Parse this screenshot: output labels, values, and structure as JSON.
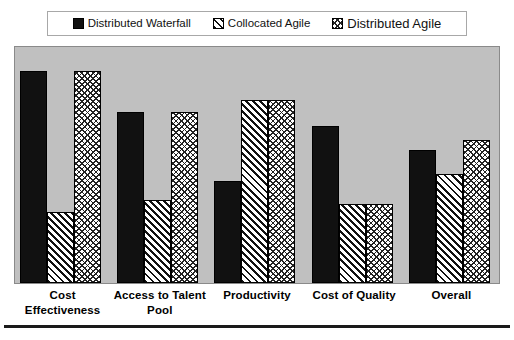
{
  "legend": {
    "items": [
      {
        "label": "Distributed Waterfall",
        "pattern": "dotted-dark",
        "swatch_color": "#111111"
      },
      {
        "label": "Collocated Agile",
        "pattern": "diagonal",
        "swatch_color": "#ffffff"
      },
      {
        "label": "Distributed Agile",
        "pattern": "crosshatch",
        "swatch_color": "#ffffff"
      }
    ]
  },
  "chart_data": {
    "type": "bar",
    "title": "",
    "xlabel": "",
    "ylabel": "",
    "ylim": [
      0,
      100
    ],
    "grid": false,
    "legend_position": "top",
    "categories": [
      "Cost Effectiveness",
      "Access to Talent Pool",
      "Productivity",
      "Cost of Quality",
      "Overall"
    ],
    "category_lines": [
      [
        "Cost",
        "Effectiveness"
      ],
      [
        "Access to Talent",
        "Pool"
      ],
      [
        "Productivity"
      ],
      [
        "Cost of Quality"
      ],
      [
        "Overall"
      ]
    ],
    "series": [
      {
        "name": "Distributed Waterfall",
        "values": [
          89,
          72,
          43,
          66,
          56
        ]
      },
      {
        "name": "Collocated Agile",
        "values": [
          30,
          35,
          77,
          33,
          46
        ]
      },
      {
        "name": "Distributed Agile",
        "values": [
          89,
          72,
          77,
          33,
          60
        ]
      }
    ]
  },
  "colors": {
    "plot_background": "#c0c0c0",
    "plot_border": "#8a8a8a",
    "bar_outline": "#000000",
    "legend_border": "#a8a8a8",
    "rule": "#1a1a1a"
  }
}
